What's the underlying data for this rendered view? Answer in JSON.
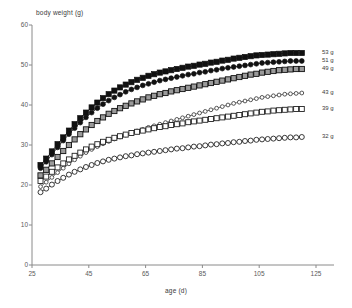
{
  "chart_data": {
    "type": "line",
    "title": "",
    "xlabel": "age (d)",
    "ylabel": "body weight (g)",
    "xlim": [
      25,
      125
    ],
    "ylim": [
      0,
      60
    ],
    "xticks": [
      25,
      45,
      65,
      85,
      105,
      125
    ],
    "yticks": [
      0,
      10,
      20,
      30,
      40,
      50,
      60
    ],
    "grid": false,
    "legend_position": "right",
    "x": [
      28,
      30,
      32,
      34,
      36,
      38,
      40,
      42,
      44,
      46,
      48,
      50,
      52,
      54,
      56,
      58,
      60,
      62,
      64,
      66,
      68,
      70,
      72,
      74,
      76,
      78,
      80,
      82,
      84,
      86,
      88,
      90,
      92,
      94,
      96,
      98,
      100,
      102,
      104,
      106,
      108,
      110,
      112,
      114,
      116,
      118,
      120
    ],
    "series": [
      {
        "name": "53 g",
        "marker": "filled-square",
        "color": "#111111",
        "fill": "#111111",
        "values": [
          25.0,
          26.6,
          28.4,
          30.2,
          31.9,
          33.6,
          35.2,
          36.7,
          38.1,
          39.4,
          40.6,
          41.7,
          42.7,
          43.6,
          44.4,
          45.1,
          45.7,
          46.3,
          46.8,
          47.3,
          47.7,
          48.1,
          48.4,
          48.7,
          49.0,
          49.3,
          49.6,
          49.8,
          50.1,
          50.3,
          50.6,
          50.8,
          51.1,
          51.3,
          51.6,
          51.8,
          52.0,
          52.2,
          52.4,
          52.5,
          52.6,
          52.7,
          52.8,
          52.9,
          53.0,
          53.0,
          53.0
        ]
      },
      {
        "name": "51 g",
        "marker": "filled-circle",
        "color": "#111111",
        "fill": "#111111",
        "values": [
          24.2,
          25.8,
          27.6,
          29.4,
          31.1,
          32.7,
          34.2,
          35.6,
          36.9,
          38.1,
          39.2,
          40.2,
          41.1,
          41.9,
          42.6,
          43.3,
          43.9,
          44.4,
          44.9,
          45.3,
          45.7,
          46.1,
          46.4,
          46.7,
          47.0,
          47.3,
          47.6,
          47.8,
          48.1,
          48.3,
          48.6,
          48.8,
          49.1,
          49.3,
          49.5,
          49.7,
          49.9,
          50.1,
          50.3,
          50.5,
          50.6,
          50.7,
          50.8,
          50.9,
          51.0,
          51.0,
          51.0
        ]
      },
      {
        "name": "49 g",
        "marker": "shaded-square",
        "color": "#111111",
        "fill": "#9a9a9a",
        "values": [
          22.4,
          23.8,
          25.4,
          27.0,
          28.5,
          30.0,
          31.4,
          32.7,
          33.9,
          35.0,
          36.0,
          36.9,
          37.8,
          38.5,
          39.2,
          39.8,
          40.4,
          40.9,
          41.4,
          41.9,
          42.3,
          42.7,
          43.0,
          43.4,
          43.7,
          44.0,
          44.3,
          44.6,
          44.9,
          45.2,
          45.5,
          45.8,
          46.1,
          46.4,
          46.7,
          47.0,
          47.3,
          47.6,
          47.8,
          48.1,
          48.3,
          48.5,
          48.7,
          48.8,
          48.9,
          49.0,
          49.0
        ]
      },
      {
        "name": "43 g",
        "marker": "open-circle-small",
        "color": "#444444",
        "fill": "#ffffff",
        "values": [
          19.6,
          20.7,
          21.9,
          23.1,
          24.2,
          25.3,
          26.3,
          27.2,
          28.1,
          28.9,
          29.6,
          30.3,
          30.9,
          31.5,
          32.0,
          32.5,
          33.0,
          33.5,
          33.9,
          34.4,
          34.8,
          35.2,
          35.6,
          36.0,
          36.4,
          36.8,
          37.2,
          37.6,
          38.0,
          38.4,
          38.8,
          39.2,
          39.6,
          40.0,
          40.4,
          40.7,
          41.0,
          41.3,
          41.6,
          41.9,
          42.1,
          42.3,
          42.5,
          42.7,
          42.8,
          42.9,
          43.0
        ]
      },
      {
        "name": "39 g",
        "marker": "open-square",
        "color": "#222222",
        "fill": "#ffffff",
        "values": [
          21.0,
          22.1,
          23.3,
          24.4,
          25.4,
          26.4,
          27.3,
          28.1,
          28.9,
          29.6,
          30.2,
          30.8,
          31.3,
          31.8,
          32.2,
          32.6,
          33.0,
          33.3,
          33.6,
          33.9,
          34.2,
          34.5,
          34.7,
          35.0,
          35.2,
          35.4,
          35.7,
          35.9,
          36.1,
          36.3,
          36.5,
          36.7,
          36.9,
          37.1,
          37.3,
          37.5,
          37.7,
          37.9,
          38.1,
          38.3,
          38.4,
          38.6,
          38.7,
          38.8,
          38.9,
          39.0,
          39.0
        ]
      },
      {
        "name": "32 g",
        "marker": "open-circle",
        "color": "#222222",
        "fill": "#ffffff",
        "values": [
          18.2,
          19.1,
          20.1,
          21.0,
          21.8,
          22.6,
          23.3,
          23.9,
          24.5,
          25.0,
          25.5,
          25.9,
          26.3,
          26.6,
          26.9,
          27.2,
          27.4,
          27.7,
          27.9,
          28.1,
          28.3,
          28.5,
          28.7,
          28.9,
          29.1,
          29.2,
          29.4,
          29.6,
          29.7,
          29.9,
          30.1,
          30.2,
          30.4,
          30.5,
          30.7,
          30.8,
          31.0,
          31.1,
          31.3,
          31.4,
          31.5,
          31.6,
          31.7,
          31.8,
          31.9,
          31.9,
          32.0
        ]
      }
    ]
  },
  "legend": {
    "entries": [
      {
        "label": "53 g"
      },
      {
        "label": "51 g"
      },
      {
        "label": "49 g"
      },
      {
        "label": "43 g"
      },
      {
        "label": "39 g"
      },
      {
        "label": "32 g"
      }
    ]
  }
}
